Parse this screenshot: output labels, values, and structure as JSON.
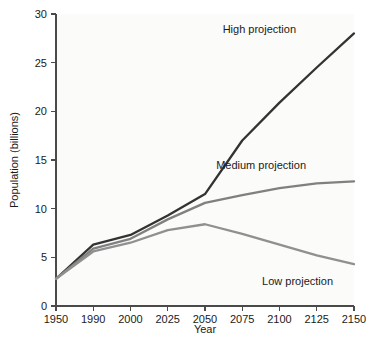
{
  "chart_data": {
    "type": "line",
    "title": "",
    "xlabel": "Year",
    "ylabel": "Population (billions)",
    "x_ticks": [
      "1950",
      "1990",
      "2000",
      "2025",
      "2050",
      "2075",
      "2100",
      "2125",
      "2150"
    ],
    "y_ticks": [
      "0",
      "5",
      "10",
      "15",
      "20",
      "25",
      "30"
    ],
    "ylim": [
      0,
      30
    ],
    "grid": false,
    "legend_position": "inline-annotations",
    "x_axis_kind": "categorical-evenly-spaced",
    "categories": [
      "1950",
      "1990",
      "2000",
      "2025",
      "2050",
      "2075",
      "2100",
      "2125",
      "2150"
    ],
    "series": [
      {
        "name": "High projection",
        "color": "#333333",
        "width": 2.3,
        "values": [
          2.8,
          6.3,
          7.3,
          9.3,
          11.5,
          17.0,
          20.9,
          24.5,
          28.0
        ],
        "annotation": "High projection",
        "annotation_x": 296,
        "annotation_y": 33
      },
      {
        "name": "Medium projection",
        "color": "#808080",
        "width": 2.3,
        "values": [
          2.8,
          5.9,
          6.9,
          8.9,
          10.6,
          11.4,
          12.1,
          12.6,
          12.8
        ],
        "annotation": "Medium projection",
        "annotation_x": 306,
        "annotation_y": 169
      },
      {
        "name": "Low projection",
        "color": "#909090",
        "width": 2.3,
        "values": [
          2.8,
          5.6,
          6.5,
          7.8,
          8.4,
          7.4,
          6.3,
          5.2,
          4.3
        ],
        "annotation": "Low projection",
        "annotation_x": 333,
        "annotation_y": 285
      }
    ]
  },
  "figure": {
    "caption": ""
  }
}
